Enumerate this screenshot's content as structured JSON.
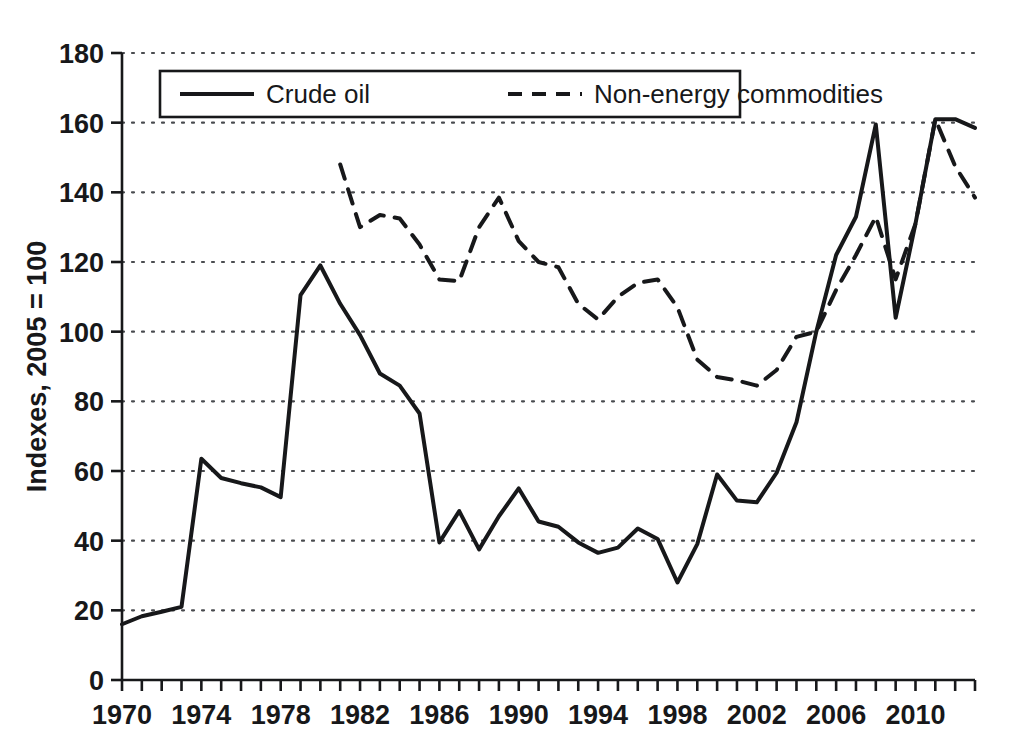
{
  "chart_data": {
    "type": "line",
    "title": "",
    "xlabel": "",
    "ylabel": "Indexes, 2005 = 100",
    "xlim": [
      1970,
      2013
    ],
    "ylim": [
      0,
      180
    ],
    "ytick_step": 20,
    "xtick_step": 1,
    "xtick_label_step": 4,
    "grid": "horizontal-dotted",
    "legend_position": "top-left-inside",
    "yticks": [
      0,
      20,
      40,
      60,
      80,
      100,
      120,
      140,
      160,
      180
    ],
    "ytick_labels": [
      "0",
      "20",
      "40",
      "60",
      "80",
      "100",
      "120",
      "140",
      "160",
      "180"
    ],
    "xtick_labels": [
      "1970",
      "1974",
      "1978",
      "1982",
      "1986",
      "1990",
      "1994",
      "1998",
      "2002",
      "2006",
      "2010"
    ],
    "xtick_label_years": [
      1970,
      1974,
      1978,
      1982,
      1986,
      1990,
      1994,
      1998,
      2002,
      2006,
      2010
    ],
    "series": [
      {
        "name": "Crude oil",
        "style": "solid",
        "color": "#17181a",
        "x": [
          1970,
          1971,
          1972,
          1973,
          1974,
          1975,
          1976,
          1977,
          1978,
          1979,
          1980,
          1981,
          1982,
          1983,
          1984,
          1985,
          1986,
          1987,
          1988,
          1989,
          1990,
          1991,
          1992,
          1993,
          1994,
          1995,
          1996,
          1997,
          1998,
          1999,
          2000,
          2001,
          2002,
          2003,
          2004,
          2005,
          2006,
          2007,
          2008,
          2009,
          2010,
          2011,
          2012,
          2013
        ],
        "values": [
          16.0,
          18.3,
          19.6,
          21.0,
          63.5,
          58.0,
          56.5,
          55.3,
          52.5,
          110.5,
          119.0,
          108.0,
          99.0,
          88.0,
          84.5,
          76.5,
          39.5,
          48.5,
          37.5,
          47.0,
          55.0,
          45.5,
          44.0,
          39.5,
          36.5,
          38.0,
          43.5,
          40.5,
          28.0,
          39.0,
          59.0,
          51.5,
          51.0,
          59.5,
          74.0,
          100.0,
          122.0,
          133.0,
          159.5,
          104.0,
          131.0,
          161.0,
          161.0,
          158.5
        ]
      },
      {
        "name": "Non-energy commodities",
        "style": "dashed",
        "color": "#17181a",
        "x": [
          1981,
          1982,
          1983,
          1984,
          1985,
          1986,
          1987,
          1988,
          1989,
          1990,
          1991,
          1992,
          1993,
          1994,
          1995,
          1996,
          1997,
          1998,
          1999,
          2000,
          2001,
          2002,
          2003,
          2004,
          2005,
          2006,
          2007,
          2008,
          2009,
          2010,
          2011,
          2012,
          2013
        ],
        "values": [
          148.0,
          130.0,
          133.5,
          132.5,
          125.0,
          115.0,
          114.5,
          130.0,
          138.5,
          126.0,
          120.0,
          118.5,
          108.0,
          103.5,
          110.0,
          114.0,
          115.0,
          107.0,
          92.0,
          87.0,
          86.0,
          84.5,
          89.0,
          98.5,
          100.0,
          112.0,
          122.0,
          133.0,
          115.0,
          131.0,
          161.0,
          147.5,
          138.5
        ]
      }
    ],
    "legend": [
      {
        "label": "Crude oil",
        "style": "solid"
      },
      {
        "label": "Non-energy commodities",
        "style": "dashed"
      }
    ]
  },
  "geometry": {
    "plot_left": 122,
    "plot_right": 975,
    "plot_top": 53,
    "plot_bottom": 680
  }
}
